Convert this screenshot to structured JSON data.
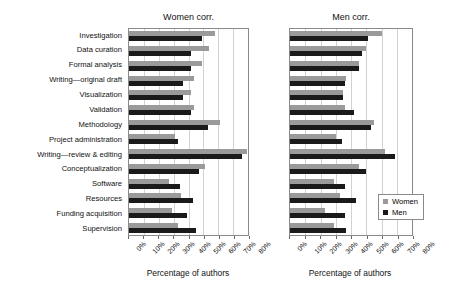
{
  "chart_data": {
    "type": "bar",
    "orientation": "horizontal",
    "title": "",
    "xlabel": "Percentage of authors",
    "ylabel": "",
    "xlim": [
      0,
      80
    ],
    "xticks": [
      0,
      10,
      20,
      30,
      40,
      50,
      60,
      70,
      80
    ],
    "xtick_labels": [
      "0%",
      "10%",
      "20%",
      "30%",
      "40%",
      "50%",
      "60%",
      "70%",
      "80%"
    ],
    "grid": true,
    "legend": {
      "position": "lower-right-of-second-panel",
      "entries": [
        {
          "name": "Women",
          "color": "#9a9a9a"
        },
        {
          "name": "Men",
          "color": "#1a1a1a"
        }
      ]
    },
    "categories": [
      "Investigation",
      "Data curation",
      "Formal analysis",
      "Writing—original draft",
      "Visualization",
      "Validation",
      "Methodology",
      "Project administration",
      "Writing—review & editing",
      "Conceptualization",
      "Software",
      "Resources",
      "Funding acquisition",
      "Supervision"
    ],
    "panels": [
      {
        "title": "Women corr.",
        "series": [
          {
            "name": "Women",
            "color": "#9a9a9a",
            "values": [
              58,
              54,
              49,
              44,
              42,
              44,
              61,
              31,
              79,
              51,
              27,
              35,
              29,
              33
            ]
          },
          {
            "name": "Men",
            "color": "#1a1a1a",
            "values": [
              49,
              42,
              42,
              36,
              36,
              42,
              53,
              33,
              76,
              47,
              34,
              43,
              39,
              45
            ]
          }
        ]
      },
      {
        "title": "Men corr.",
        "series": [
          {
            "name": "Women",
            "color": "#9a9a9a",
            "values": [
              60,
              50,
              45,
              37,
              35,
              36,
              55,
              30,
              62,
              45,
              29,
              33,
              23,
              29
            ]
          },
          {
            "name": "Men",
            "color": "#1a1a1a",
            "values": [
              51,
              47,
              45,
              36,
              35,
              42,
              53,
              34,
              69,
              50,
              36,
              43,
              36,
              37
            ]
          }
        ]
      }
    ]
  },
  "axis_label_shared": "Percentage of authors"
}
